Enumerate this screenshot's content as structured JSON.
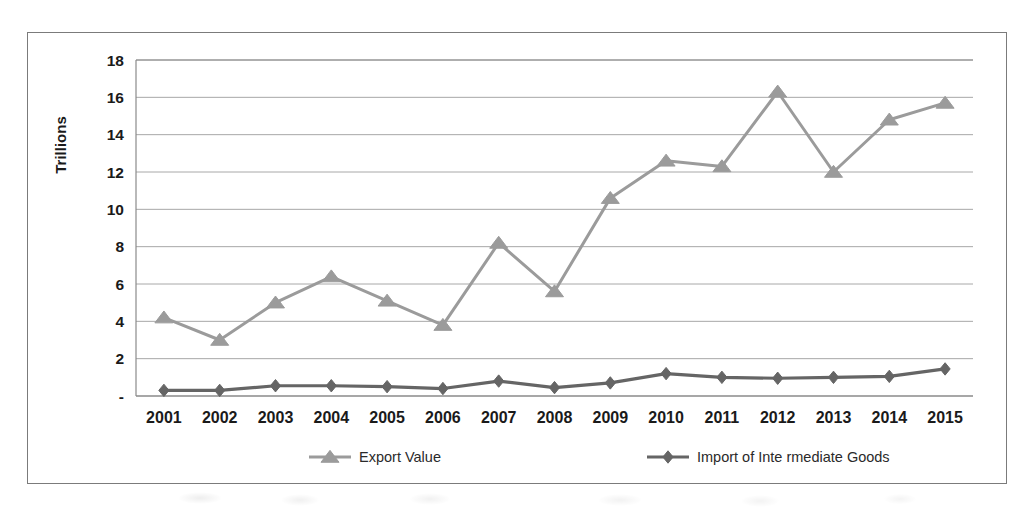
{
  "chart_data": {
    "type": "line",
    "title": "",
    "xlabel": "",
    "ylabel": "Trillions",
    "ylim": [
      0,
      18
    ],
    "ytick_labels": [
      "18",
      "16",
      "14",
      "12",
      "10",
      "8",
      "6",
      "4",
      "2",
      "-"
    ],
    "ytick_values": [
      18,
      16,
      14,
      12,
      10,
      8,
      6,
      4,
      2,
      0
    ],
    "grid": true,
    "legend_position": "bottom",
    "categories": [
      "2001",
      "2002",
      "2003",
      "2004",
      "2005",
      "2006",
      "2007",
      "2008",
      "2009",
      "2010",
      "2011",
      "2012",
      "2013",
      "2014",
      "2015"
    ],
    "x": [
      2001,
      2002,
      2003,
      2004,
      2005,
      2006,
      2007,
      2008,
      2009,
      2010,
      2011,
      2012,
      2013,
      2014,
      2015
    ],
    "series": [
      {
        "name": "Export Value",
        "marker": "triangle",
        "color": "#9b9b9b",
        "values": [
          4.2,
          3.0,
          5.0,
          6.4,
          5.1,
          3.8,
          8.2,
          5.6,
          10.6,
          12.6,
          12.3,
          16.3,
          12.0,
          14.8,
          15.7
        ]
      },
      {
        "name": "Import of Intermediate Goods",
        "marker": "diamond",
        "color": "#656565",
        "values": [
          0.3,
          0.3,
          0.55,
          0.55,
          0.5,
          0.4,
          0.8,
          0.45,
          0.7,
          1.2,
          1.0,
          0.95,
          1.0,
          1.05,
          1.45
        ]
      }
    ]
  },
  "colors": {
    "export_series": "#9b9b9b",
    "import_series": "#656565",
    "gridline": "#a8a8a8",
    "axis": "#8a8a8a",
    "frame": "#7b7b7b",
    "text": "#1a1a1a"
  },
  "legend": {
    "items": [
      {
        "label": "Export Value"
      },
      {
        "label": "Import of Inte rmediate Goods"
      }
    ]
  },
  "axes": {
    "y_title": "Trillions"
  }
}
